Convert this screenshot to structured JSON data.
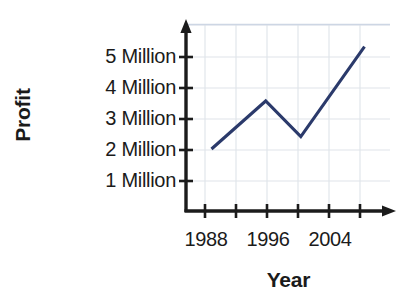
{
  "chart_data": {
    "type": "line",
    "title": "",
    "subtitle": "",
    "xlabel": "Year",
    "ylabel": "Profit",
    "x": [
      1988,
      1996.5,
      2002,
      2012
    ],
    "values": [
      2.0,
      3.55,
      2.4,
      5.3
    ],
    "series": [
      {
        "name": "Profit",
        "x": [
          1988,
          1996.5,
          2002,
          2012
        ],
        "values": [
          2.0,
          3.55,
          2.4,
          5.3
        ]
      }
    ],
    "xlim": [
      1984,
      2016
    ],
    "ylim": [
      0,
      6
    ],
    "xticks": [
      1988,
      1992,
      1996,
      2000,
      2004,
      2008
    ],
    "xtick_labels": [
      "1988",
      "",
      "1996",
      "",
      "2004",
      ""
    ],
    "yticks": [
      1,
      2,
      3,
      4,
      5
    ],
    "ytick_labels": [
      "1 Million",
      "2 Million",
      "3 Million",
      "4 Million",
      "5 Million"
    ],
    "grid": true,
    "legend": false,
    "legend_position": "none",
    "line_color": "#2b3a6b",
    "grid_color": "#dfe3ea",
    "axis_color": "#1b1b1b",
    "annotations": []
  },
  "axes": {
    "y_title": "Profit",
    "x_title": "Year",
    "y_tick_labels": [
      {
        "value": "5 Million"
      },
      {
        "value": "4 Million"
      },
      {
        "value": "3 Million"
      },
      {
        "value": "2 Million"
      },
      {
        "value": "1 Million"
      }
    ],
    "x_tick_labels": [
      {
        "value": "1988"
      },
      {
        "value": "1996"
      },
      {
        "value": "2004"
      }
    ]
  },
  "colors": {
    "line": "#2b3a6b",
    "grid": "#dfe3ea",
    "axis": "#1b1b1b",
    "background": "#ffffff",
    "text": "#1b1b1b"
  }
}
